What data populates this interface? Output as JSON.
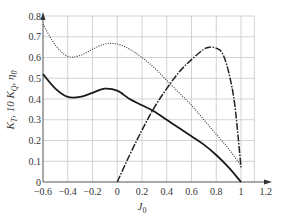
{
  "chart_data": {
    "type": "line",
    "title": "",
    "xlabel": "J_0",
    "ylabel": "K_T, 10 K_Q, η_0",
    "xlim": [
      -0.6,
      1.2
    ],
    "ylim": [
      0,
      0.8
    ],
    "xticks": [
      -0.6,
      -0.4,
      -0.2,
      0,
      0.2,
      0.4,
      0.6,
      0.8,
      1,
      1.2
    ],
    "xtick_labels": [
      "−0.6",
      "−0.4",
      "−0.2",
      "0",
      "0.2",
      "0.4",
      "0.6",
      "0.8",
      "1",
      "1.2"
    ],
    "yticks": [
      0,
      0.1,
      0.2,
      0.3,
      0.4,
      0.5,
      0.6,
      0.7,
      0.8
    ],
    "ytick_labels": [
      "0",
      "0.1",
      "0.2",
      "0.3",
      "0.4",
      "0.5",
      "0.6",
      "0.7",
      "0.8"
    ],
    "grid": true,
    "legend": "none",
    "series": [
      {
        "name": "K_T",
        "style": "solid",
        "x": [
          -0.6,
          -0.5,
          -0.4,
          -0.3,
          -0.2,
          -0.1,
          0.0,
          0.1,
          0.2,
          0.3,
          0.4,
          0.5,
          0.6,
          0.7,
          0.8,
          0.9,
          1.0
        ],
        "y": [
          0.52,
          0.45,
          0.41,
          0.41,
          0.43,
          0.45,
          0.44,
          0.4,
          0.37,
          0.34,
          0.3,
          0.26,
          0.22,
          0.18,
          0.13,
          0.07,
          0.0
        ]
      },
      {
        "name": "10 K_Q",
        "style": "dotted",
        "x": [
          -0.6,
          -0.5,
          -0.4,
          -0.3,
          -0.2,
          -0.1,
          0.0,
          0.1,
          0.2,
          0.3,
          0.4,
          0.5,
          0.6,
          0.7,
          0.8,
          0.9,
          1.0
        ],
        "y": [
          0.76,
          0.66,
          0.605,
          0.61,
          0.64,
          0.665,
          0.665,
          0.64,
          0.6,
          0.55,
          0.49,
          0.43,
          0.37,
          0.3,
          0.23,
          0.16,
          0.08
        ]
      },
      {
        "name": "η_0",
        "style": "dashed",
        "x": [
          0.0,
          0.1,
          0.2,
          0.3,
          0.4,
          0.5,
          0.6,
          0.7,
          0.75,
          0.8,
          0.85,
          0.9,
          0.95,
          1.0
        ],
        "y": [
          0.0,
          0.13,
          0.25,
          0.36,
          0.45,
          0.53,
          0.59,
          0.64,
          0.65,
          0.645,
          0.62,
          0.53,
          0.37,
          0.07
        ]
      }
    ]
  }
}
